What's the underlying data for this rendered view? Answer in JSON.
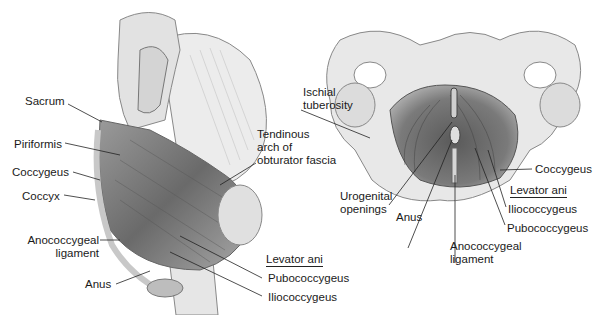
{
  "figure": {
    "left_view": {
      "description": "Lateral (sagittal) view of pelvic floor muscles",
      "labels": {
        "sacrum": "Sacrum",
        "piriformis": "Piriformis",
        "coccygeus": "Coccygeus",
        "coccyx": "Coccyx",
        "anococcygeal_1": "Anococcygeal",
        "anococcygeal_2": "ligament",
        "anus": "Anus",
        "tendinous_1": "Tendinous",
        "tendinous_2": "arch of",
        "tendinous_3": "obturator fascia",
        "levator_ani": "Levator ani",
        "pubococcygeus": "Pubococcygeus",
        "iliococcygeus": "Iliococcygeus"
      }
    },
    "right_view": {
      "description": "Inferior view of pelvic floor",
      "labels": {
        "ischial_1": "Ischial",
        "ischial_2": "tuberosity",
        "urogenital_1": "Urogenital",
        "urogenital_2": "openings",
        "anus": "Anus",
        "anococcygeal_1": "Anococcygeal",
        "anococcygeal_2": "ligament",
        "coccygeus": "Coccygeus",
        "levator_ani": "Levator ani",
        "iliococcygeus": "Iliococcygeus",
        "pubococcygeus": "Pubococcygeus"
      }
    },
    "colors": {
      "bone": "#e4e4e4",
      "muscle": "#8a8a8a",
      "muscle_dark": "#4a4a4a",
      "line": "#222222"
    }
  }
}
